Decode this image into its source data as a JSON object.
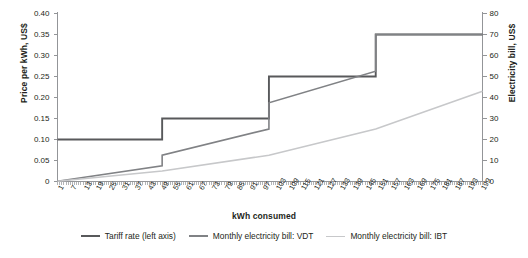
{
  "chart_data": {
    "type": "line",
    "title": "",
    "xlabel": "kWh consumed",
    "ylabel": "Price per kWh, US$",
    "ylabel_right": "Electricity bill, US$",
    "xlim": [
      1,
      200
    ],
    "ylim": [
      0,
      0.4
    ],
    "ylim_right": [
      0,
      80
    ],
    "grid": false,
    "legend_position": "bottom",
    "x_ticks": [
      "1",
      "7",
      "13",
      "19",
      "25",
      "31",
      "37",
      "43",
      "49",
      "55",
      "61",
      "67",
      "73",
      "79",
      "85",
      "91",
      "97",
      "103",
      "109",
      "115",
      "121",
      "127",
      "133",
      "139",
      "145",
      "151",
      "157",
      "163",
      "169",
      "175",
      "181",
      "187",
      "193",
      "199"
    ],
    "y_ticks_left": [
      "0",
      "0.05",
      "0.10",
      "0.15",
      "0.20",
      "0.25",
      "0.30",
      "0.35",
      "0.40"
    ],
    "y_ticks_right": [
      "0",
      "10",
      "20",
      "30",
      "40",
      "50",
      "60",
      "70",
      "80"
    ],
    "series": [
      {
        "name": "Tariff rate (left axis)",
        "axis": "left",
        "color": "#58595b",
        "width": 1.9,
        "type": "step",
        "breakpoints": [
          1,
          50,
          100,
          150,
          200
        ],
        "step_values": [
          0.1,
          0.15,
          0.25,
          0.35
        ]
      },
      {
        "name": "Monthly electricity bill: VDT",
        "axis": "right",
        "color": "#808285",
        "width": 1.6,
        "type": "piecewise",
        "points": [
          {
            "x": 1,
            "y": 0.1
          },
          {
            "x": 50,
            "y": 7.5
          },
          {
            "x": 50,
            "y": 12.5
          },
          {
            "x": 100,
            "y": 25.0
          },
          {
            "x": 100,
            "y": 37.5
          },
          {
            "x": 150,
            "y": 52.5
          },
          {
            "x": 150,
            "y": 70.0
          },
          {
            "x": 200,
            "y": 70.0
          }
        ]
      },
      {
        "name": "Monthly electricity bill: IBT",
        "axis": "right",
        "color": "#c7c8ca",
        "width": 1.6,
        "type": "piecewise",
        "points": [
          {
            "x": 1,
            "y": 0.1
          },
          {
            "x": 50,
            "y": 5.0
          },
          {
            "x": 100,
            "y": 12.5
          },
          {
            "x": 150,
            "y": 25.0
          },
          {
            "x": 200,
            "y": 43.0
          }
        ]
      }
    ]
  },
  "legend": {
    "items": [
      {
        "label": "Tariff rate (left axis)",
        "color": "#58595b",
        "width": "2.4px"
      },
      {
        "label": "Monthly electricity bill: VDT",
        "color": "#808285",
        "width": "2px"
      },
      {
        "label": "Monthly electricity bill: IBT",
        "color": "#c7c8ca",
        "width": "1.8px"
      }
    ]
  }
}
